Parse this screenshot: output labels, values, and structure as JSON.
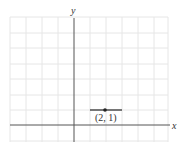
{
  "diagram": {
    "type": "coordinate-plane",
    "axes": {
      "x_label": "x",
      "y_label": "y"
    },
    "point": {
      "label": "(2, 1)",
      "x": 2,
      "y": 1
    },
    "colors": {
      "grid": "#e4e4e4",
      "axis": "#555555",
      "point": "#222222"
    }
  }
}
